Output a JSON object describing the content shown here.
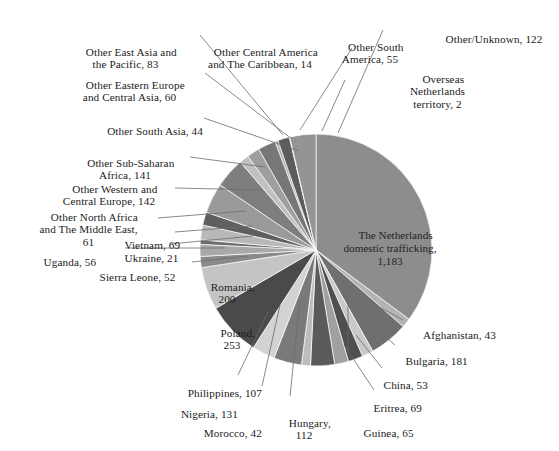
{
  "chart_data": {
    "type": "pie",
    "title": "",
    "subtitle": "",
    "xlabel": "",
    "ylabel": "",
    "legend_position": "none",
    "grid": false,
    "units": "number of victims",
    "total": 3286,
    "start_angle_deg": 0,
    "direction": "clockwise",
    "categories": [
      "The Netherlands domestic trafficking",
      "Afghanistan",
      "Bulgaria",
      "China",
      "Eritrea",
      "Guinea",
      "Hungary",
      "Morocco",
      "Nigeria",
      "Philippines",
      "Poland",
      "Romania",
      "Sierra Leone",
      "Uganda",
      "Ukraine",
      "Vietnam",
      "Other North Africa and The Middle East",
      "Other Western and Central Europe",
      "Other Sub-Saharan Africa",
      "Other South Asia",
      "Other Eastern Europe and Central Asia",
      "Other East Asia and the Pacific",
      "Other Central America and The Caribbean",
      "Other South America",
      "Overseas Netherlands territory",
      "Other/Unknown"
    ],
    "values": [
      1183,
      43,
      181,
      53,
      69,
      65,
      112,
      42,
      131,
      107,
      253,
      200,
      52,
      56,
      21,
      69,
      61,
      142,
      141,
      44,
      60,
      83,
      14,
      55,
      2,
      122
    ],
    "colors": [
      "#8d8d8d",
      "#b3b3b3",
      "#6f6f6f",
      "#c9c9c9",
      "#4f4f4f",
      "#a0a0a0",
      "#5a5a5a",
      "#bdbdbd",
      "#7a7a7a",
      "#d2d2d2",
      "#4a4a4a",
      "#c4c4c4",
      "#8a8a8a",
      "#a8a8a8",
      "#6a6a6a",
      "#b8b8b8",
      "#5f5f5f",
      "#9a9a9a",
      "#7e7e7e",
      "#c0c0c0",
      "#9f9f9f",
      "#777777",
      "#b0b0b0",
      "#5c5c5c",
      "#d6d6d6",
      "#949494"
    ]
  },
  "labels": {
    "netherlands": "The Netherlands\ndomestic trafficking,\n1,183",
    "other_unknown": "Other/Unknown, 122",
    "overseas": "Overseas\nNetherlands\nterritory, 2",
    "other_south_america": "Other South\nAmerica, 55",
    "other_central_america": "Other Central America\nand The Caribbean, 14",
    "other_east_asia": "Other East Asia and\nthe Pacific, 83",
    "other_eastern_europe": "Other Eastern Europe\nand Central Asia, 60",
    "other_south_asia": "Other South Asia, 44",
    "other_subsaharan": "Other Sub-Saharan\nAfrica, 141",
    "other_western_europe": "Other Western and\nCentral Europe, 142",
    "other_north_africa": "Other North Africa\nand The Middle East,\n61",
    "vietnam": "Vietnam, 69",
    "ukraine": "Ukraine, 21",
    "uganda": "Uganda, 56",
    "sierra_leone": "Sierra Leone, 52",
    "romania": "Romania,\n200",
    "poland": "Poland,\n253",
    "philippines": "Philippines, 107",
    "nigeria": "Nigeria, 131",
    "morocco": "Morocco, 42",
    "hungary": "Hungary,\n112",
    "guinea": "Guinea, 65",
    "eritrea": "Eritrea, 69",
    "china": "China, 53",
    "bulgaria": "Bulgaria, 181",
    "afghanistan": "Afghanistan, 43"
  }
}
